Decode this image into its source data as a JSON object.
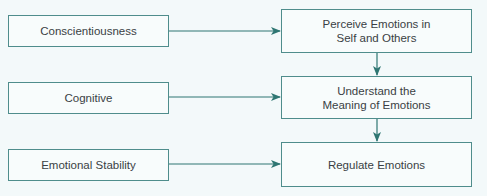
{
  "diagram": {
    "type": "flowchart",
    "colors": {
      "background": "#f3f9fa",
      "box_border": "#4f8d8c",
      "arrow": "#2e7672",
      "text": "#3a3f44"
    },
    "left_nodes": [
      {
        "id": "conscientiousness",
        "label": "Conscientiousness"
      },
      {
        "id": "cognitive",
        "label": "Cognitive"
      },
      {
        "id": "emotional-stability",
        "label": "Emotional Stability"
      }
    ],
    "right_nodes": [
      {
        "id": "perceive",
        "label": "Perceive Emotions in Self and Others"
      },
      {
        "id": "understand",
        "label": "Understand the Meaning of Emotions"
      },
      {
        "id": "regulate",
        "label": "Regulate Emotions"
      }
    ],
    "edges": [
      {
        "from": "conscientiousness",
        "to": "perceive"
      },
      {
        "from": "cognitive",
        "to": "understand"
      },
      {
        "from": "emotional-stability",
        "to": "regulate"
      },
      {
        "from": "perceive",
        "to": "understand"
      },
      {
        "from": "understand",
        "to": "regulate"
      }
    ]
  }
}
